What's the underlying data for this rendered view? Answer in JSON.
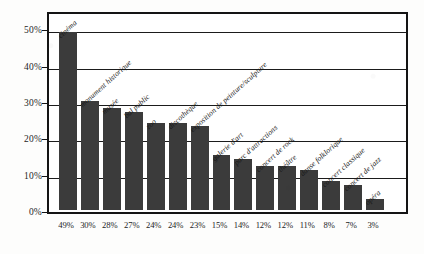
{
  "chart_data": {
    "type": "bar",
    "title": "",
    "subtitle": "",
    "xlabel": "",
    "ylabel": "",
    "ylim": [
      0,
      55
    ],
    "grid": true,
    "legend": "none",
    "orientation": "vertical",
    "bar_color": "#3b3b3b",
    "categories": [
      "cinéma",
      "monument historique",
      "musée",
      "bal public",
      "zoo",
      "discothèque",
      "exposition de peinture/sculpture",
      "galerie d'art",
      "parc d'attractions",
      "concert de rock",
      "théâtre",
      "danse folklorique",
      "concert classique",
      "concert de jazz",
      "opéra"
    ],
    "values": [
      49,
      30,
      28,
      27,
      24,
      24,
      23,
      15,
      14,
      12,
      12,
      11,
      8,
      7,
      3
    ],
    "value_labels": [
      "49%",
      "30%",
      "28%",
      "27%",
      "24%",
      "24%",
      "23%",
      "15%",
      "14%",
      "12%",
      "12%",
      "11%",
      "8%",
      "7%",
      "3%"
    ],
    "ytick_values": [
      0,
      10,
      20,
      30,
      40,
      50
    ],
    "ytick_labels": [
      "0%",
      "10%",
      "20%",
      "30%",
      "40%",
      "50%"
    ]
  }
}
